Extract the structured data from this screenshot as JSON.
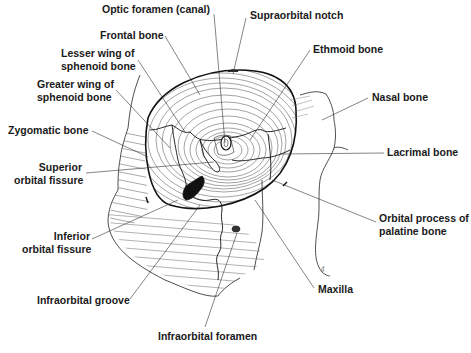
{
  "diagram": {
    "labels": [
      {
        "id": "optic-foramen",
        "text": "Optic foramen (canal)",
        "x": 102,
        "y": 7,
        "align": "left"
      },
      {
        "id": "supraorbital-notch",
        "text": "Supraorbital notch",
        "x": 250,
        "y": 12,
        "align": "left"
      },
      {
        "id": "frontal-bone",
        "text": "Frontal bone",
        "x": 100,
        "y": 30,
        "align": "left"
      },
      {
        "id": "ethmoid-bone",
        "text": "Ethmoid bone",
        "x": 313,
        "y": 44,
        "align": "left"
      },
      {
        "id": "lesser-wing-sphenoid",
        "text": "Lesser wing of\nsphenoid bone",
        "x": 60,
        "y": 48,
        "align": "left"
      },
      {
        "id": "greater-wing-sphenoid",
        "text": "Greater wing of\nsphenoid bone",
        "x": 38,
        "y": 79,
        "align": "left"
      },
      {
        "id": "nasal-bone",
        "text": "Nasal bone",
        "x": 371,
        "y": 92,
        "align": "left"
      },
      {
        "id": "zygomatic-bone",
        "text": "Zygomatic bone",
        "x": 8,
        "y": 125,
        "align": "left"
      },
      {
        "id": "lacrimal-bone",
        "text": "Lacrimal bone",
        "x": 387,
        "y": 147,
        "align": "left"
      },
      {
        "id": "superior-orbital-fissure",
        "text": "Superior\norbital fissure",
        "x": 14,
        "y": 162,
        "align": "right"
      },
      {
        "id": "orbital-process-palatine",
        "text": "Orbital process of\npalatine bone",
        "x": 379,
        "y": 213,
        "align": "left"
      },
      {
        "id": "inferior-orbital-fissure",
        "text": "Inferior\norbital fissure",
        "x": 22,
        "y": 232,
        "align": "right"
      },
      {
        "id": "maxilla",
        "text": "Maxilla",
        "x": 318,
        "y": 284,
        "align": "left"
      },
      {
        "id": "infraorbital-groove",
        "text": "Infraorbital groove",
        "x": 37,
        "y": 295,
        "align": "left"
      },
      {
        "id": "infraorbital-foramen",
        "text": "Infraorbital foramen",
        "x": 158,
        "y": 331,
        "align": "left"
      }
    ],
    "leader_lines": [
      {
        "label": "optic-foramen",
        "x1": 214,
        "y1": 14,
        "x2": 225,
        "y2": 143
      },
      {
        "label": "supraorbital-notch",
        "x1": 246,
        "y1": 18,
        "x2": 233,
        "y2": 74
      },
      {
        "label": "frontal-bone",
        "x1": 165,
        "y1": 36,
        "x2": 200,
        "y2": 95
      },
      {
        "label": "ethmoid-bone",
        "x1": 310,
        "y1": 50,
        "x2": 250,
        "y2": 140
      },
      {
        "label": "lesser-wing-sphenoid",
        "x1": 138,
        "y1": 60,
        "x2": 185,
        "y2": 132
      },
      {
        "label": "greater-wing-sphenoid",
        "x1": 116,
        "y1": 90,
        "x2": 170,
        "y2": 148
      },
      {
        "label": "nasal-bone",
        "x1": 368,
        "y1": 98,
        "x2": 322,
        "y2": 120
      },
      {
        "label": "zygomatic-bone",
        "x1": 92,
        "y1": 131,
        "x2": 148,
        "y2": 157
      },
      {
        "label": "lacrimal-bone",
        "x1": 384,
        "y1": 153,
        "x2": 280,
        "y2": 154
      },
      {
        "label": "superior-orbital-fissure",
        "x1": 86,
        "y1": 173,
        "x2": 214,
        "y2": 162
      },
      {
        "label": "orbital-process-palatine",
        "x1": 376,
        "y1": 222,
        "x2": 272,
        "y2": 180
      },
      {
        "label": "inferior-orbital-fissure",
        "x1": 92,
        "y1": 239,
        "x2": 178,
        "y2": 200
      },
      {
        "label": "maxilla",
        "x1": 314,
        "y1": 288,
        "x2": 255,
        "y2": 200
      },
      {
        "label": "infraorbital-groove",
        "x1": 130,
        "y1": 299,
        "x2": 200,
        "y2": 205
      },
      {
        "label": "infraorbital-foramen",
        "x1": 205,
        "y1": 327,
        "x2": 237,
        "y2": 233
      }
    ],
    "page_number": "4"
  }
}
